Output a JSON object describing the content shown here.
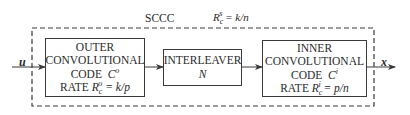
{
  "diagram": {
    "title": "SCCC",
    "overall_rate": {
      "symbol": "R",
      "sup": "s",
      "sub": "c",
      "value": "= k/n"
    },
    "input_label": "u",
    "output_label": "x",
    "blocks": [
      {
        "id": "outer",
        "lines": [
          "OUTER",
          "CONVOLUTIONAL"
        ],
        "code_label": "CODE",
        "code_symbol": "C",
        "code_sup": "o",
        "rate_label": "RATE",
        "rate_symbol": "R",
        "rate_sup": "o",
        "rate_sub": "c",
        "rate_value": "= k/p"
      },
      {
        "id": "interleaver",
        "lines": [
          "INTERLEAVER"
        ],
        "param": "N"
      },
      {
        "id": "inner",
        "lines": [
          "INNER",
          "CONVOLUTIONAL"
        ],
        "code_label": "CODE",
        "code_symbol": "C",
        "code_sup": "i",
        "rate_label": "RATE",
        "rate_symbol": "R",
        "rate_sup": "i",
        "rate_sub": "c",
        "rate_value": "= p/n"
      }
    ],
    "colors": {
      "line": "#3a3a3a",
      "background": "#ffffff",
      "text": "#2a2a2a"
    }
  }
}
